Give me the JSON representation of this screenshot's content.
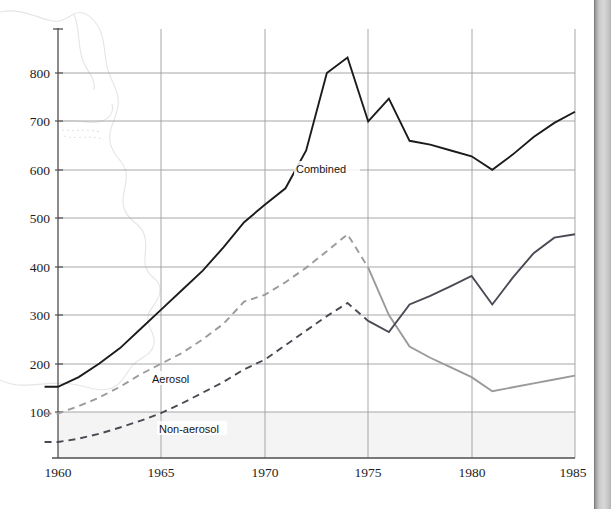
{
  "chart_data": {
    "type": "line",
    "title": "",
    "subtitle": "",
    "xlabel": "",
    "ylabel": "",
    "xlim": [
      1959.3,
      1985
    ],
    "ylim": [
      0,
      870
    ],
    "xticks": [
      1960,
      1965,
      1970,
      1975,
      1980,
      1985
    ],
    "yticks": [
      100,
      200,
      300,
      400,
      500,
      600,
      700,
      800
    ],
    "grid": "both-axes-light-gray",
    "legend": "inline-series-labels",
    "annotations": [
      {
        "text": "Combined",
        "x": 1971.6,
        "y": 600
      },
      {
        "text": "Aerosol",
        "x": 1964.5,
        "y": 170
      },
      {
        "text": "Non-aerosol",
        "x": 1964.9,
        "y": 67
      }
    ],
    "background_watermark": "faint-map-outline",
    "series": [
      {
        "name": "Combined",
        "color": "#1b1b1b",
        "style": "solid",
        "width": 1.9,
        "x": [
          1959.35,
          1960,
          1961,
          1962,
          1963,
          1964,
          1965,
          1966,
          1967,
          1968,
          1969,
          1970,
          1971,
          1972,
          1973,
          1974,
          1975,
          1976,
          1977,
          1978,
          1979,
          1980,
          1981,
          1982,
          1983,
          1984,
          1985
        ],
        "values": [
          152,
          152,
          172,
          200,
          232,
          272,
          312,
          352,
          392,
          440,
          492,
          528,
          562,
          640,
          800,
          832,
          700,
          747,
          660,
          652,
          640,
          628,
          600,
          632,
          668,
          697,
          720
        ]
      },
      {
        "name": "Aerosol",
        "color": "#9a9a9a",
        "style": "dashed-then-solid",
        "style_switch_x": 1975,
        "width": 1.9,
        "x": [
          1959.35,
          1960,
          1961,
          1962,
          1963,
          1964,
          1965,
          1966,
          1967,
          1968,
          1969,
          1970,
          1971,
          1972,
          1973,
          1974,
          1975,
          1976,
          1977,
          1978,
          1979,
          1980,
          1981,
          1982,
          1983,
          1984,
          1985
        ],
        "values": [
          97,
          97,
          112,
          130,
          152,
          178,
          200,
          222,
          250,
          282,
          328,
          342,
          368,
          398,
          432,
          467,
          398,
          300,
          235,
          212,
          192,
          172,
          143,
          151,
          159,
          167,
          175
        ]
      },
      {
        "name": "Non-aerosol",
        "color": "#4a4a55",
        "style": "dashed-then-solid",
        "style_switch_x": 1975,
        "width": 1.9,
        "x": [
          1959.35,
          1960,
          1961,
          1962,
          1963,
          1964,
          1965,
          1966,
          1967,
          1968,
          1969,
          1970,
          1971,
          1972,
          1973,
          1974,
          1975,
          1976,
          1977,
          1978,
          1979,
          1980,
          1981,
          1982,
          1983,
          1984,
          1985
        ],
        "values": [
          38,
          38,
          45,
          55,
          68,
          82,
          98,
          118,
          140,
          162,
          188,
          208,
          238,
          268,
          298,
          325,
          288,
          265,
          322,
          340,
          360,
          381,
          322,
          378,
          428,
          460,
          467
        ]
      }
    ]
  },
  "axis": {
    "y_tick_labels": [
      "800",
      "700",
      "600",
      "500",
      "400",
      "300",
      "200",
      "100"
    ],
    "x_tick_labels": [
      "1960",
      "1965",
      "1970",
      "1975",
      "1980",
      "1985"
    ]
  },
  "labels": {
    "combined": "Combined",
    "aerosol": "Aerosol",
    "nonaerosol": "Non-aerosol"
  },
  "colors": {
    "combined": "#1b1b1b",
    "aerosol": "#9a9a9a",
    "nonaerosol": "#4a4a55",
    "grid": "#9d9d9d",
    "axis": "#4f4f4f",
    "plot_fill": "#f4f4f4"
  }
}
